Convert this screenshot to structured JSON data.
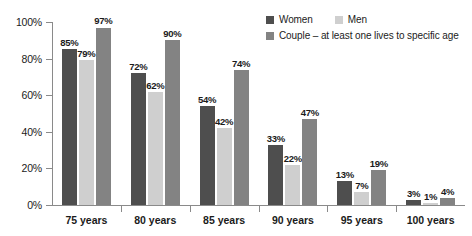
{
  "chart_data": {
    "type": "bar",
    "title": "",
    "subtitle": "",
    "xlabel": "",
    "ylabel": "",
    "ylim": [
      0,
      100
    ],
    "y_ticks": [
      "0%",
      "20%",
      "40%",
      "60%",
      "80%",
      "100%"
    ],
    "y_tick_values": [
      0,
      20,
      40,
      60,
      80,
      100
    ],
    "grid": false,
    "legend_position": "top-right",
    "categories": [
      "75 years",
      "80 years",
      "85 years",
      "90 years",
      "95 years",
      "100 years"
    ],
    "series": [
      {
        "name": "Women",
        "color": "#4e4e4e",
        "values": [
          85,
          72,
          54,
          33,
          13,
          3
        ],
        "labels": [
          "85%",
          "72%",
          "54%",
          "33%",
          "13%",
          "3%"
        ]
      },
      {
        "name": "Men",
        "color": "#cfcfcf",
        "values": [
          79,
          62,
          42,
          22,
          7,
          1
        ],
        "labels": [
          "79%",
          "62%",
          "42%",
          "22%",
          "7%",
          "1%"
        ]
      },
      {
        "name": "Couple – at least one lives to specific age",
        "color": "#838383",
        "values": [
          97,
          90,
          74,
          47,
          19,
          4
        ],
        "labels": [
          "97%",
          "90%",
          "74%",
          "47%",
          "19%",
          "4%"
        ]
      }
    ]
  },
  "legend": {
    "row1": [
      {
        "label": "Women",
        "swatch": "women"
      },
      {
        "label": "Men",
        "swatch": "men"
      }
    ],
    "row2": [
      {
        "label": "Couple – at least one lives to specific age",
        "swatch": "couple"
      }
    ]
  }
}
